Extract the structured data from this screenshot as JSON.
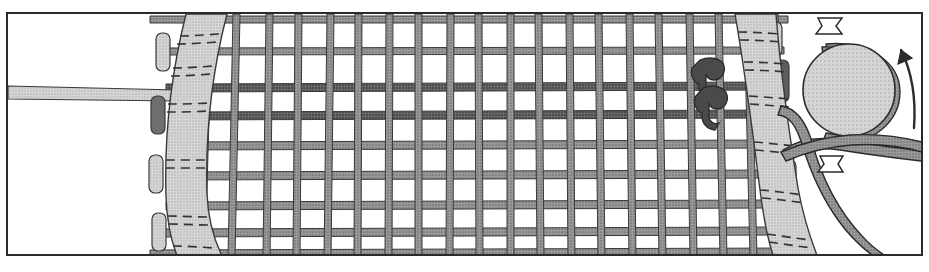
{
  "figure": {
    "kind": "technical-line-art",
    "background_color": "#ffffff",
    "frame": {
      "stroke_color": "#2b2b2b",
      "stroke_width": 2,
      "x": 7,
      "y": 13,
      "width": 915,
      "height": 242
    }
  },
  "palette": {
    "outline": "#2b2b2b",
    "mesh_bar_fill": "#8d8d8d",
    "mesh_bar_fill_dark": "#5a5a5a",
    "strap_fill": "#cfcfcf",
    "strap_stitch": "#3a3a3a",
    "tab_fill": "#a9a9a9",
    "clip_fill": "#4f4f4f",
    "drum_fill": "#cccccc",
    "cord_fill": "#8d8d8d",
    "arrow_fill": "#ffffff",
    "rod_fill": "#c9c9c9",
    "paper_white": "#ffffff"
  },
  "mesh": {
    "label": "grid-mesh-panel",
    "vertical_bar_count": 20,
    "horizontal_bar_count": 9,
    "bar_width_px": 7,
    "highlight_rows": [
      2,
      3
    ],
    "highlight_note": "two darker horizontal bars near upper third"
  },
  "straps": [
    {
      "name": "left-strap",
      "side": "left",
      "curve": "bows outward to the left at top and bottom",
      "stitch_rows": 10,
      "tab_count": 4,
      "fill": "#cfcfcf"
    },
    {
      "name": "right-strap",
      "side": "right",
      "curve": "bows outward to the right at top and bottom",
      "stitch_rows": 10,
      "tab_count": 4,
      "fill": "#cfcfcf"
    }
  ],
  "clips": [
    {
      "name": "upper-clip",
      "attached_to": "horizontal-bar-2",
      "fill": "#4f4f4f"
    },
    {
      "name": "lower-clip",
      "attached_to": "horizontal-bar-3",
      "fill": "#4f4f4f"
    }
  ],
  "rod": {
    "name": "tapered-rod",
    "direction": "extends left out of frame",
    "fill": "#c9c9c9"
  },
  "drum": {
    "name": "cord-drum",
    "shape": "circle",
    "cx": 849,
    "cy": 90,
    "r": 46,
    "fill": "#cccccc",
    "cord_wrapped": true
  },
  "cord": {
    "name": "wound-cord",
    "fill": "#8d8d8d",
    "path_note": "wraps the drum, passes left under the straps and trails down to the lower right"
  },
  "arrows": [
    {
      "name": "cord-direction-arrow-top",
      "position": "top of drum",
      "style": "open flag",
      "fill": "#ffffff"
    },
    {
      "name": "cord-direction-arrow-bottom",
      "position": "below drum",
      "style": "open flag",
      "fill": "#ffffff"
    },
    {
      "name": "rotation-arrow",
      "position": "right of drum",
      "style": "curved counter-clockwise",
      "fill": "#2b2b2b"
    }
  ],
  "caption": {
    "text": "",
    "visible": false,
    "note": "a line of text is cropped off at the very bottom edge and is illegible"
  }
}
